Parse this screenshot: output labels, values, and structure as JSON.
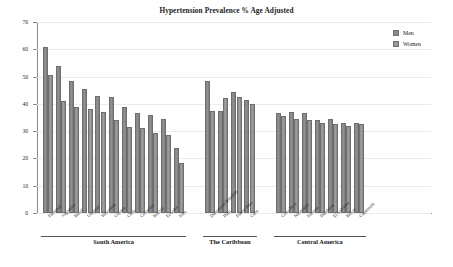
{
  "chart_data": {
    "type": "bar",
    "title": "Hypertension Prevalence % Age Adjusted",
    "xlabel": "",
    "ylabel": "Prevalence (%)",
    "ylim": [
      0,
      70
    ],
    "yticks": [
      0,
      10,
      20,
      30,
      40,
      50,
      60,
      70
    ],
    "grid": true,
    "legend_position": "top-right",
    "series": [
      {
        "name": "Men",
        "color": "#8b8b8b",
        "values": [
          61.0,
          54.0,
          48.5,
          45.5,
          43.0,
          42.5,
          39.0,
          36.5,
          36.0,
          34.5,
          24.0,
          48.5,
          37.5,
          44.5,
          41.5,
          36.5,
          37.0,
          36.5,
          34.0,
          34.5,
          33.0,
          33.0
        ]
      },
      {
        "name": "Women",
        "color": "#9a9a9a",
        "values": [
          50.5,
          41.0,
          39.0,
          38.0,
          37.0,
          34.0,
          31.5,
          31.0,
          29.5,
          28.5,
          18.5,
          37.5,
          42.0,
          42.5,
          40.0,
          35.5,
          34.5,
          34.0,
          33.0,
          32.5,
          32.0,
          32.5
        ]
      }
    ],
    "categories": [
      "Paraguay",
      "Argentina",
      "Brazil",
      "Uruguay",
      "Venezuela",
      "Guyana",
      "Chile",
      "Colombia",
      "Bolivia",
      "Ecuador",
      "Peru",
      "Dominican Republic",
      "Haiti",
      "Puerto Rico",
      "Cuba",
      "Costa Rica",
      "Nicaragua",
      "Panama",
      "Honduras",
      "El Salvador",
      "Belize",
      "Guatemala"
    ],
    "groups": [
      {
        "label": "South America",
        "start": 0,
        "count": 11
      },
      {
        "label": "The Caribbean",
        "start": 11,
        "count": 4
      },
      {
        "label": "Central America",
        "start": 15,
        "count": 7
      }
    ]
  },
  "legend": {
    "items": [
      {
        "label": "Men",
        "color": "#8b8b8b"
      },
      {
        "label": "Women",
        "color": "#9a9a9a"
      }
    ]
  }
}
